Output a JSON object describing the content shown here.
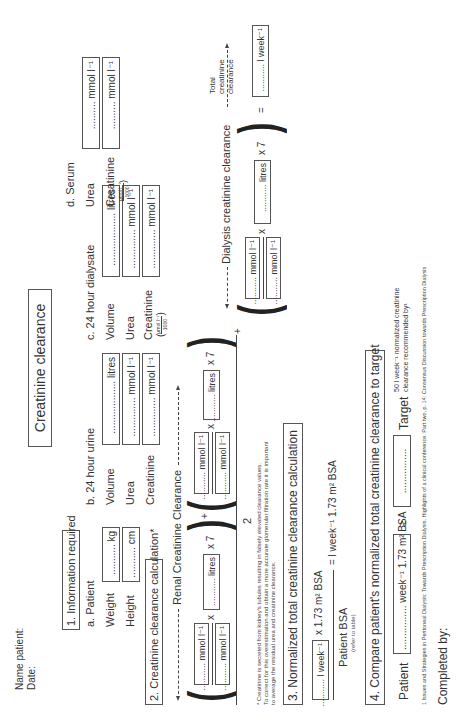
{
  "header": {
    "name_label": "Name patient:",
    "date_label": "Date:",
    "title": "Creatinine clearance"
  },
  "section1": {
    "title": "1. Information required",
    "patient": {
      "heading": "a. Patient",
      "weight_label": "Weight",
      "weight_field": "........... kg",
      "height_label": "Height",
      "height_field": "........... cm"
    },
    "urine": {
      "heading": "b. 24 hour urine",
      "volume_label": "Volume",
      "volume_field": "................... litres",
      "urea_label": "Urea",
      "urea_field": ".............. mmol l⁻¹",
      "creatinine_label": "Creatinine",
      "creatinine_field": ".............. mmol l⁻¹"
    },
    "dialysate": {
      "heading": "c. 24 hour dialysate",
      "volume_label": "Volume",
      "volume_field": "................... litres",
      "urea_label": "Urea",
      "urea_field": ".............. mmol l⁻¹",
      "creatinine_label": "Creatinine",
      "creatinine_field": ".............. mmol l⁻¹",
      "conv_num": "μmol l⁻¹",
      "conv_den": "1000"
    },
    "serum": {
      "heading": "d. Serum",
      "urea_label": "Urea",
      "urea_field": ".......... mmol l⁻¹",
      "creatinine_label": "Creatinine",
      "creatinine_field": ".......... mmol l⁻¹",
      "conv_num": "μmol l⁻¹",
      "conv_den": "1000"
    }
  },
  "section2": {
    "title": "2. Creatinine clearance calculation*",
    "renal_label": "Renal Creatinine Clearance",
    "dialysis_label": "Dialysis creatinine clearance",
    "mmol_field": "........... mmol l⁻¹",
    "litres_field": "........... litres",
    "times": "x",
    "times7": "x 7",
    "plus": "+",
    "divisor": "2",
    "equals": "=",
    "total_label_1": "Total",
    "total_label_2": "creatinine",
    "total_label_3": "clearance",
    "total_field": "........... l week⁻¹",
    "footnote_1": "* Creatinine is secreted from kidney's tubules resulting in falsely elevated clearance values.",
    "footnote_2": "To correct for this overestimation and obtain a more accurate glomerular filtration rate it is important",
    "footnote_3": "to average the residual urea and creatinine clearance."
  },
  "section3": {
    "title": "3. Normalized total creatinine clearance calculation",
    "field": "........... l week⁻¹",
    "multiplier": "x 1.73 m² BSA",
    "denominator": "Patient BSA",
    "denominator_note": "(refer to table)",
    "result": "= l week⁻¹ 1.73 m² BSA"
  },
  "section4": {
    "title": "4. Compare patient's normalized total creatinine clearance to target",
    "patient_label": "Patient",
    "patient_field": "................ week⁻¹ 1.73 m² BSA",
    "gte": "≥",
    "target_field": "................",
    "target_label": "Target",
    "target_note_1": "50 l week⁻¹ normalized creatinine",
    "target_note_2": "clearance recommended by¹"
  },
  "footer": {
    "reference": "1 Issues and Strategies in Peritoneal Dialysis: Towards Prescription Dialysis. Highlights of a clinical conference. Part two, p. 14: Consensus Discussion towards Prescription Dialysis",
    "completed_by": "Completed by:"
  }
}
